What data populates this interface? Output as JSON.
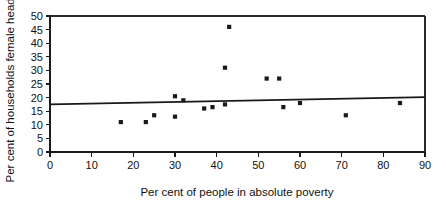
{
  "chart_data": {
    "type": "scatter",
    "title": "",
    "xlabel": "Per cent of people in absolute poverty",
    "ylabel": "Per cent of households female headed",
    "xlim": [
      0,
      90
    ],
    "ylim": [
      0,
      50
    ],
    "xticks": [
      0,
      10,
      20,
      30,
      40,
      50,
      60,
      70,
      80,
      90
    ],
    "xtick_labels": [
      "0",
      "10",
      "20",
      "30",
      "40",
      "50",
      "60",
      "70",
      "80",
      "90"
    ],
    "yticks": [
      0,
      5,
      10,
      15,
      20,
      25,
      30,
      35,
      40,
      45,
      50
    ],
    "ytick_labels": [
      "0",
      "5",
      "10",
      "15",
      "20",
      "25",
      "30",
      "35",
      "40",
      "45",
      "50"
    ],
    "grid": false,
    "legend": null,
    "marker": "square",
    "points": [
      {
        "x": 17,
        "y": 11
      },
      {
        "x": 23,
        "y": 11
      },
      {
        "x": 25,
        "y": 13.5
      },
      {
        "x": 30,
        "y": 13
      },
      {
        "x": 30,
        "y": 20.5
      },
      {
        "x": 32,
        "y": 19
      },
      {
        "x": 37,
        "y": 16
      },
      {
        "x": 39,
        "y": 16.5
      },
      {
        "x": 42,
        "y": 31
      },
      {
        "x": 42,
        "y": 17.5
      },
      {
        "x": 43,
        "y": 46
      },
      {
        "x": 52,
        "y": 27
      },
      {
        "x": 55,
        "y": 27
      },
      {
        "x": 56,
        "y": 16.5
      },
      {
        "x": 60,
        "y": 18
      },
      {
        "x": 71,
        "y": 13.5
      },
      {
        "x": 84,
        "y": 18
      }
    ],
    "trendline": {
      "x0": 0,
      "y0": 17.5,
      "x1": 90,
      "y1": 20.2,
      "label": "linear fit"
    }
  }
}
